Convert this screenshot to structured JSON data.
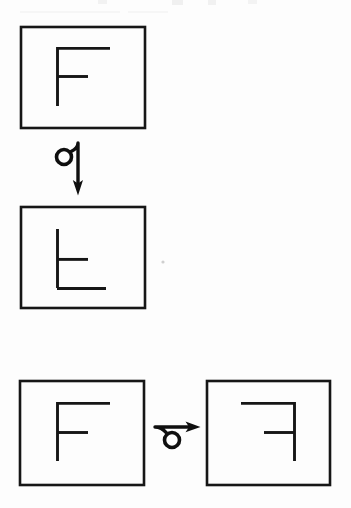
{
  "document": {
    "title": "Mental rotation worksheet - letter F transformations",
    "background_color": "#fdfdfd",
    "ink_color": "#161616",
    "width": 351,
    "height": 508
  },
  "figure": {
    "kind": "hand-drawn diagram",
    "panels": [
      {
        "id": "panel-top",
        "data_name": "panel-top-original-f",
        "label": "upright F",
        "orientation": "0deg",
        "frame": {
          "x": 21,
          "y": 27,
          "width": 124,
          "height": 101
        },
        "glyph": {
          "name": "letter-f-upright",
          "stem": {
            "x": 57,
            "y1": 47,
            "y2": 106
          },
          "top_arm": {
            "y": 47,
            "x1": 57,
            "x2": 110
          },
          "mid_arm": {
            "y": 76,
            "x1": 57,
            "x2": 88
          }
        }
      },
      {
        "id": "panel-middle",
        "data_name": "panel-middle-rotated-f",
        "label": "F rotated 90 degrees clockwise",
        "orientation": "90deg-cw",
        "frame": {
          "x": 21,
          "y": 207,
          "width": 124,
          "height": 101
        },
        "glyph": {
          "name": "letter-f-rotated-90",
          "stem": {
            "x": 57,
            "y1": 229,
            "y2": 288
          },
          "top_arm": {
            "y": 258,
            "x1": 57,
            "x2": 88
          },
          "mid_arm": {
            "y": 288,
            "x1": 57,
            "x2": 106
          }
        }
      },
      {
        "id": "panel-bottom-left",
        "data_name": "panel-bottom-left-original-f",
        "label": "upright F",
        "orientation": "0deg",
        "frame": {
          "x": 20,
          "y": 381,
          "width": 124,
          "height": 104
        },
        "glyph": {
          "name": "letter-f-upright",
          "stem": {
            "x": 57,
            "y1": 402,
            "y2": 461
          },
          "top_arm": {
            "y": 402,
            "x1": 57,
            "x2": 110
          },
          "mid_arm": {
            "y": 432,
            "x1": 57,
            "x2": 88
          }
        }
      },
      {
        "id": "panel-bottom-right",
        "data_name": "panel-bottom-right-mirrored-f",
        "label": "F mirrored horizontally",
        "orientation": "mirror-horizontal",
        "frame": {
          "x": 207,
          "y": 381,
          "width": 123,
          "height": 104
        },
        "glyph": {
          "name": "letter-f-mirrored",
          "stem": {
            "x": 294,
            "y1": 402,
            "y2": 461
          },
          "top_arm": {
            "y": 402,
            "x1": 241,
            "x2": 294
          },
          "mid_arm": {
            "y": 432,
            "x1": 264,
            "x2": 294
          }
        }
      }
    ],
    "arrows": [
      {
        "id": "arrow-vertical",
        "data_name": "rotation-arrow-down",
        "label": "downward curl arrow",
        "direction": "down",
        "from_panel": "panel-top",
        "to_panel": "panel-middle",
        "loop": {
          "cx": 64,
          "cy": 157,
          "r": 7.5
        },
        "shaft": {
          "x": 78,
          "y1": 143,
          "y2": 186
        },
        "head_tip": {
          "x": 78,
          "y": 194
        }
      },
      {
        "id": "arrow-horizontal",
        "data_name": "rotation-arrow-right",
        "label": "rightward curl arrow",
        "direction": "right",
        "from_panel": "panel-bottom-left",
        "to_panel": "panel-bottom-right",
        "loop": {
          "cx": 172,
          "cy": 440,
          "r": 7.5
        },
        "shaft": {
          "y": 427,
          "x1": 155,
          "x2": 192
        },
        "head_tip": {
          "x": 199,
          "y": 427
        }
      }
    ],
    "artifacts": [
      {
        "data_name": "scan-speck",
        "x": 163,
        "y": 262,
        "r": 1.6
      },
      {
        "data_name": "top-edge-smudge",
        "x": 0,
        "y": 0,
        "width": 351,
        "height": 7
      }
    ]
  }
}
